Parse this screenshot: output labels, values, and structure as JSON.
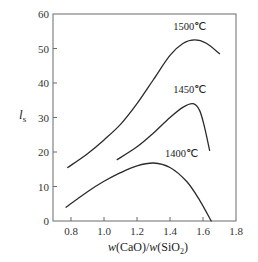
{
  "chart_data": {
    "type": "line",
    "title": "",
    "xlabel": "w(CaO)/w(SiO2)",
    "xlabel_parts": {
      "w1": "w",
      "num": "(CaO)/",
      "w2": "w",
      "den_pre": "(SiO",
      "den_sub": "2",
      "den_post": ")"
    },
    "ylabel": "l_s",
    "ylabel_parts": {
      "main": "l",
      "sub": "s"
    },
    "xlim": [
      0.7,
      1.8
    ],
    "ylim": [
      0,
      60
    ],
    "xticks": [
      "0.8",
      "1.0",
      "1.2",
      "1.4",
      "1.6",
      "1.8"
    ],
    "xtick_values": [
      0.8,
      1.0,
      1.2,
      1.4,
      1.6,
      1.8
    ],
    "yticks": [
      "0",
      "10",
      "20",
      "30",
      "40",
      "50",
      "60"
    ],
    "ytick_values": [
      0,
      10,
      20,
      30,
      40,
      50,
      60
    ],
    "grid": false,
    "legend": "inline curve labels",
    "series": [
      {
        "name": "1500℃",
        "label": "1500℃",
        "x": [
          0.78,
          0.9,
          1.0,
          1.1,
          1.2,
          1.3,
          1.4,
          1.48,
          1.55,
          1.62,
          1.7
        ],
        "y": [
          15.5,
          19.5,
          23.5,
          28.0,
          34.0,
          41.0,
          48.0,
          51.5,
          52.5,
          51.5,
          48.5
        ],
        "label_pos": [
          1.52,
          55.5
        ]
      },
      {
        "name": "1450℃",
        "label": "1450℃",
        "x": [
          1.08,
          1.2,
          1.3,
          1.4,
          1.48,
          1.54,
          1.58,
          1.61,
          1.64
        ],
        "y": [
          17.8,
          21.5,
          25.5,
          30.0,
          33.0,
          34.0,
          32.0,
          27.0,
          20.5
        ],
        "label_pos": [
          1.52,
          37.0
        ]
      },
      {
        "name": "1400℃",
        "label": "1400℃",
        "x": [
          0.77,
          0.9,
          1.0,
          1.1,
          1.2,
          1.3,
          1.4,
          1.5,
          1.58,
          1.65
        ],
        "y": [
          4.0,
          8.5,
          11.5,
          14.0,
          16.0,
          16.8,
          15.5,
          11.5,
          6.0,
          0.0
        ],
        "label_pos": [
          1.47,
          18.5
        ]
      }
    ]
  }
}
